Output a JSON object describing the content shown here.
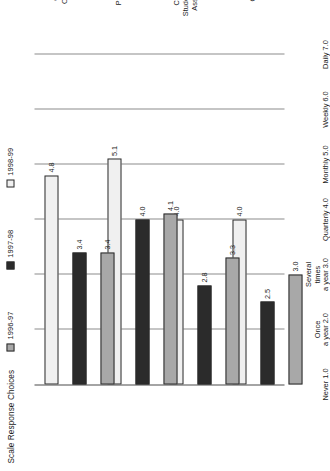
{
  "figure": {
    "title": "Scale Response Choices"
  },
  "legend": {
    "position": "top",
    "items": [
      {
        "label": "1996-97",
        "color": "#a8a8a8",
        "swatch_name": "legend-swatch-1996-97"
      },
      {
        "label": "1997-98",
        "color": "#2b2b2b",
        "swatch_name": "legend-swatch-1997-98"
      },
      {
        "label": "1998-99",
        "color": "#f0f0f0",
        "swatch_name": "legend-swatch-1998-99"
      }
    ]
  },
  "chart_data": {
    "type": "bar",
    "orientation": "horizontal",
    "title": "Scale Response Choices",
    "xlabel": "",
    "ylabel": "",
    "xlim": [
      1.0,
      7.0
    ],
    "grid": true,
    "legend_position": "top",
    "categories": [
      "Curriculum\nCoordination\nPractices",
      "Coordination of\nStudent Assignments,\nAssessments, and\nFeedback",
      "Parent Contact\nand\nInvolvement",
      "Contact with\nOther Building\nResource"
    ],
    "axis_ticks": [
      {
        "value": 1.0,
        "label": "Never",
        "number": "1.0"
      },
      {
        "value": 2.0,
        "label": "Once\na year",
        "number": "2.0"
      },
      {
        "value": 3.0,
        "label": "Several\ntimes\na year",
        "number": "3.0"
      },
      {
        "value": 4.0,
        "label": "Quarterly",
        "number": "4.0"
      },
      {
        "value": 5.0,
        "label": "Monthly",
        "number": "5.0"
      },
      {
        "value": 6.0,
        "label": "Weekly",
        "number": "6.0"
      },
      {
        "value": 7.0,
        "label": "Daily",
        "number": "7.0"
      }
    ],
    "series": [
      {
        "name": "1996-97",
        "color": "#a8a8a8",
        "values": [
          3.0,
          3.3,
          4.1,
          3.4
        ]
      },
      {
        "name": "1997-98",
        "color": "#2b2b2b",
        "values": [
          2.5,
          2.8,
          4.0,
          3.4
        ]
      },
      {
        "name": "1998-99",
        "color": "#f0f0f0",
        "values": [
          4.0,
          4.0,
          5.1,
          4.8
        ]
      }
    ],
    "data_labels": [
      [
        "3.0",
        "2.5",
        "4.0"
      ],
      [
        "3.3",
        "2.8",
        "4.0"
      ],
      [
        "4.1",
        "4.0",
        "5.1"
      ],
      [
        "3.4",
        "3.4",
        "4.8"
      ]
    ]
  }
}
